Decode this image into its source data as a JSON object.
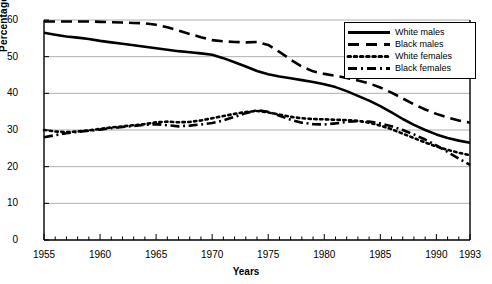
{
  "chart_data": {
    "type": "line",
    "title": "",
    "xlabel": "Years",
    "ylabel": "Percentage",
    "xlim": [
      1955,
      1993
    ],
    "ylim": [
      0,
      60
    ],
    "grid": true,
    "legend_position": "top-right",
    "xticks": [
      "1955",
      "1960",
      "1965",
      "1970",
      "1975",
      "1980",
      "1985",
      "1990",
      "1993"
    ],
    "xtick_values": [
      1955,
      1960,
      1965,
      1970,
      1975,
      1980,
      1985,
      1990,
      1993
    ],
    "yticks": [
      "0",
      "10",
      "20",
      "30",
      "40",
      "50",
      "60"
    ],
    "ytick_values": [
      0,
      10,
      20,
      30,
      40,
      50,
      60
    ],
    "minor_xticks": "every 1 year",
    "x": [
      1955,
      1956,
      1957,
      1958,
      1959,
      1960,
      1961,
      1962,
      1963,
      1964,
      1965,
      1966,
      1967,
      1968,
      1969,
      1970,
      1971,
      1972,
      1973,
      1974,
      1975,
      1976,
      1977,
      1978,
      1979,
      1980,
      1981,
      1982,
      1983,
      1984,
      1985,
      1986,
      1987,
      1988,
      1989,
      1990,
      1991,
      1992,
      1993
    ],
    "series": [
      {
        "name": "White males",
        "style": "solid",
        "color": "#000000",
        "values": [
          56.5,
          56.0,
          55.5,
          55.2,
          54.8,
          54.3,
          53.9,
          53.5,
          53.1,
          52.7,
          52.3,
          51.9,
          51.5,
          51.2,
          50.9,
          50.5,
          49.6,
          48.5,
          47.3,
          46.1,
          45.2,
          44.6,
          44.1,
          43.6,
          43.1,
          42.5,
          41.7,
          40.6,
          39.3,
          38.0,
          36.5,
          34.8,
          33.0,
          31.4,
          30.0,
          28.8,
          27.8,
          27.1,
          26.5
        ]
      },
      {
        "name": "Black males",
        "style": "dashed",
        "color": "#000000",
        "values": [
          59.6,
          59.6,
          59.6,
          59.6,
          59.6,
          59.5,
          59.4,
          59.3,
          59.2,
          59.1,
          58.7,
          58.0,
          57.1,
          56.2,
          55.3,
          54.5,
          54.2,
          54.0,
          53.9,
          54.0,
          53.2,
          51.3,
          49.2,
          47.3,
          46.0,
          45.3,
          44.8,
          44.2,
          43.5,
          42.7,
          41.6,
          40.2,
          38.6,
          37.0,
          35.6,
          34.4,
          33.4,
          32.6,
          32.0
        ]
      },
      {
        "name": "White females",
        "style": "dotted",
        "color": "#000000",
        "values": [
          30.0,
          29.6,
          29.4,
          29.6,
          29.9,
          30.3,
          30.7,
          31.0,
          31.3,
          31.6,
          32.1,
          32.3,
          32.1,
          32.2,
          32.6,
          33.2,
          33.8,
          34.4,
          34.9,
          35.2,
          34.8,
          34.2,
          33.6,
          33.2,
          33.0,
          32.9,
          32.8,
          32.7,
          32.5,
          32.0,
          31.2,
          30.2,
          29.0,
          27.8,
          26.6,
          25.5,
          24.6,
          23.8,
          23.1
        ]
      },
      {
        "name": "Black females",
        "style": "dashdot",
        "color": "#000000",
        "values": [
          28.0,
          28.6,
          29.1,
          29.5,
          29.8,
          30.1,
          30.5,
          30.8,
          31.1,
          31.4,
          31.6,
          31.3,
          31.0,
          31.2,
          31.5,
          31.9,
          32.6,
          33.6,
          34.6,
          35.4,
          35.0,
          33.9,
          32.8,
          32.0,
          31.6,
          31.5,
          31.8,
          32.2,
          32.4,
          32.3,
          31.8,
          31.0,
          30.0,
          28.8,
          27.4,
          25.8,
          24.0,
          22.2,
          20.5
        ]
      }
    ]
  },
  "legend": {
    "items": [
      {
        "label": "White males",
        "style": "solid"
      },
      {
        "label": "Black males",
        "style": "dashed"
      },
      {
        "label": "White females",
        "style": "dotted"
      },
      {
        "label": "Black females",
        "style": "dashdot"
      }
    ]
  }
}
